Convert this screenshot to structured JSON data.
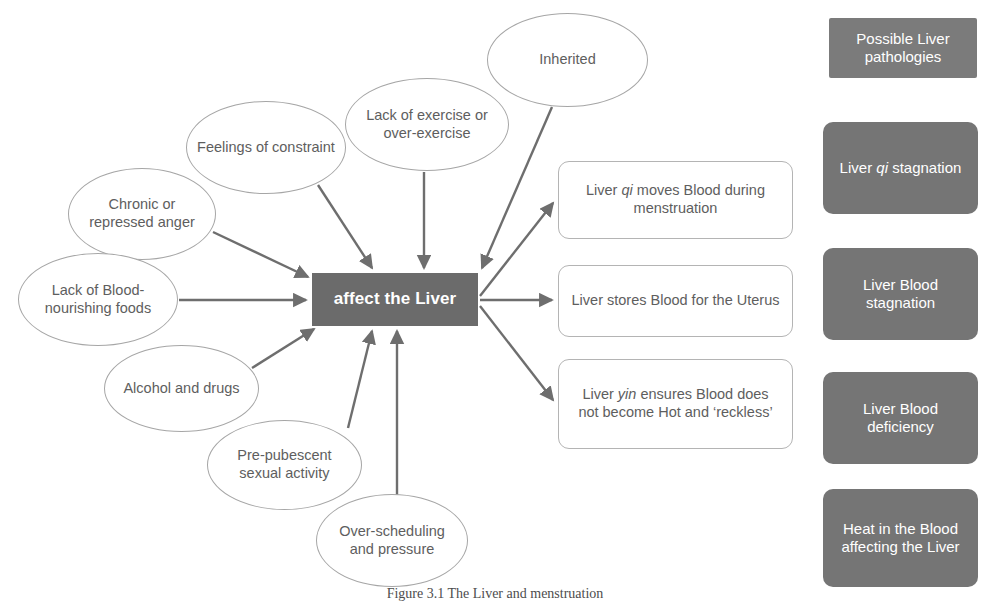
{
  "diagram": {
    "center": {
      "label": "affect the Liver",
      "color": "#6b6b6b"
    },
    "causes": [
      {
        "id": "chronic-anger",
        "label": "Chronic or repressed anger",
        "x": 68,
        "y": 168,
        "w": 148,
        "h": 92
      },
      {
        "id": "feelings-constraint",
        "label": "Feelings of constraint",
        "x": 186,
        "y": 101,
        "w": 160,
        "h": 93
      },
      {
        "id": "lack-exercise",
        "label": "Lack of exercise or over-exercise",
        "x": 345,
        "y": 78,
        "w": 164,
        "h": 93
      },
      {
        "id": "inherited",
        "label": "Inherited",
        "x": 487,
        "y": 13,
        "w": 161,
        "h": 94
      },
      {
        "id": "lack-blood-foods",
        "label": "Lack of Blood-nourishing foods",
        "x": 18,
        "y": 253,
        "w": 160,
        "h": 93
      },
      {
        "id": "alcohol-drugs",
        "label": "Alcohol and drugs",
        "x": 104,
        "y": 345,
        "w": 155,
        "h": 87
      },
      {
        "id": "pre-pubescent",
        "label": "Pre-pubescent sexual activity",
        "x": 207,
        "y": 420,
        "w": 155,
        "h": 90
      },
      {
        "id": "over-scheduling",
        "label": "Over-scheduling and pressure",
        "x": 316,
        "y": 494,
        "w": 152,
        "h": 93
      }
    ],
    "functions": [
      {
        "id": "liver-qi-moves",
        "pre": "Liver ",
        "em": "qi",
        "post": " moves Blood during menstruation",
        "x": 558,
        "y": 161,
        "w": 235,
        "h": 78
      },
      {
        "id": "liver-stores",
        "pre": "Liver stores Blood for the Uterus",
        "em": "",
        "post": "",
        "x": 558,
        "y": 265,
        "w": 235,
        "h": 72
      },
      {
        "id": "liver-yin",
        "pre": "Liver ",
        "em": "yin",
        "post": " ensures Blood does not become Hot and ‘reckless’",
        "x": 558,
        "y": 359,
        "w": 235,
        "h": 90
      }
    ],
    "pathologies": {
      "heading": {
        "label": "Possible Liver pathologies",
        "x": 829,
        "y": 18,
        "w": 148,
        "h": 60,
        "shape": "square"
      },
      "items": [
        {
          "id": "liver-qi-stagnation",
          "pre": "Liver ",
          "em": "qi",
          "post": " stagnation",
          "x": 823,
          "y": 122,
          "w": 155,
          "h": 92
        },
        {
          "id": "liver-blood-stagnation",
          "pre": "Liver Blood stagnation",
          "em": "",
          "post": "",
          "x": 823,
          "y": 248,
          "w": 155,
          "h": 92
        },
        {
          "id": "liver-blood-deficiency",
          "pre": "Liver Blood deficiency",
          "em": "",
          "post": "",
          "x": 823,
          "y": 372,
          "w": 155,
          "h": 92
        },
        {
          "id": "heat-in-blood",
          "pre": "Heat in the Blood affecting the Liver",
          "em": "",
          "post": "",
          "x": 823,
          "y": 489,
          "w": 155,
          "h": 98
        }
      ],
      "color": "#757575"
    },
    "caption": "Figure 3.1  The Liver and menstruation",
    "arrow_color": "#6e6e6e"
  }
}
